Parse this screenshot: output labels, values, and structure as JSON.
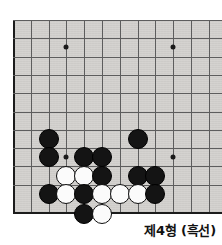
{
  "caption": {
    "text": "제4형 (흑선)",
    "problem_number": 4,
    "to_play": "흑선"
  },
  "board": {
    "type": "go-board",
    "region": "lower-left-corner",
    "background_color": "#d4d2cf",
    "grid_line_color": "#5d5d5d",
    "edge_line_color": "#1c1c1c",
    "black_stone_color": "#141414",
    "white_stone_color": "#fbfbfb",
    "columns": 12,
    "rows": 11,
    "cell_width": 17.8,
    "cell_height": 18.3,
    "origin_x": 13,
    "origin_y": 20,
    "stone_diameter": 20,
    "star_points": [
      {
        "col": 3,
        "row": 1.5
      },
      {
        "col": 9,
        "row": 1.5
      },
      {
        "col": 3,
        "row": 7.5
      },
      {
        "col": 9,
        "row": 7.5
      }
    ],
    "stones": [
      {
        "color": "black",
        "col": 2,
        "row": 6.5
      },
      {
        "color": "black",
        "col": 2,
        "row": 7.5
      },
      {
        "color": "black",
        "col": 4,
        "row": 7.5
      },
      {
        "color": "black",
        "col": 5,
        "row": 7.5
      },
      {
        "color": "black",
        "col": 7,
        "row": 6.5
      },
      {
        "color": "white",
        "col": 3,
        "row": 8.5
      },
      {
        "color": "white",
        "col": 4,
        "row": 8.5
      },
      {
        "color": "black",
        "col": 5,
        "row": 8.5
      },
      {
        "color": "black",
        "col": 7,
        "row": 8.5
      },
      {
        "color": "black",
        "col": 8,
        "row": 8.5
      },
      {
        "color": "black",
        "col": 2,
        "row": 9.5
      },
      {
        "color": "white",
        "col": 3,
        "row": 9.5
      },
      {
        "color": "black",
        "col": 4,
        "row": 9.5
      },
      {
        "color": "white",
        "col": 5,
        "row": 9.5
      },
      {
        "color": "white",
        "col": 6,
        "row": 9.5
      },
      {
        "color": "white",
        "col": 7,
        "row": 9.5
      },
      {
        "color": "black",
        "col": 8,
        "row": 9.5
      },
      {
        "color": "black",
        "col": 4,
        "row": 10.6
      },
      {
        "color": "white",
        "col": 5,
        "row": 10.6
      }
    ]
  }
}
